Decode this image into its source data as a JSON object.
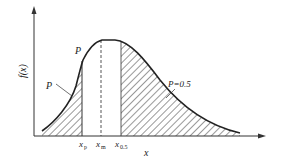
{
  "diagram": {
    "type": "probability-density-curve",
    "y_axis_label": "f(x)",
    "x_axis_label": "x",
    "tick_labels": {
      "xp_main": "x",
      "xp_sub": "p",
      "xm_main": "x",
      "xm_sub": "m",
      "x05_main": "x",
      "x05_sub": "0.5"
    },
    "annotations": {
      "left_area": "P",
      "point_on_curve": "P",
      "right_area": "P=0.5"
    },
    "colors": {
      "line": "#222222",
      "background": "#ffffff"
    }
  }
}
